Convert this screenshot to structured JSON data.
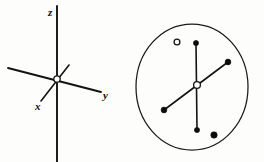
{
  "figure": {
    "width": 264,
    "height": 162,
    "background_color": "#fdfdfc",
    "ink_color": "#131313",
    "panels": [
      {
        "id": "axes-panel",
        "name": "cartesian-axes-diagram",
        "description": "Three dimensional cartesian coordinate axes drawn in perspective with a small open circle marking the origin."
      },
      {
        "id": "orbital-panel",
        "name": "circular-orbital-diagram",
        "description": "A large circle enclosing an open circle at the centre, a vertical segment terminating in filled dots at both ends, a diagonal segment terminating in filled dots at both ends, one free-standing open circle at upper left and one free-standing filled dot at lower right."
      }
    ]
  },
  "axes_diagram": {
    "origin_label": "origin-node",
    "origin": {
      "x": 57,
      "y": 79,
      "radius": 3.2,
      "style": "open"
    },
    "labels": [
      {
        "name": "z-axis-label",
        "text": "z",
        "x": 50,
        "y": 14
      },
      {
        "name": "y-axis-label",
        "text": "y",
        "x": 105,
        "y": 97
      },
      {
        "name": "x-axis-label",
        "text": "x",
        "x": 38,
        "y": 107
      }
    ],
    "axes": [
      {
        "name": "z-axis-line",
        "text": "z",
        "x1": 57,
        "y1": 6,
        "x2": 57,
        "y2": 162,
        "width": 1.9
      },
      {
        "name": "y-axis-line",
        "text": "y",
        "x1": 8,
        "y1": 68,
        "x2": 101,
        "y2": 92,
        "width": 1.9
      },
      {
        "name": "x-axis-line",
        "text": "x",
        "x1": 41,
        "y1": 101,
        "x2": 69,
        "y2": 65,
        "width": 1.6
      }
    ]
  },
  "orbital_diagram": {
    "ring": {
      "name": "outer-circle",
      "cx": 192,
      "cy": 87,
      "rx": 56,
      "ry": 63,
      "stroke_width": 1.25
    },
    "center_node": {
      "name": "center-open-circle",
      "cx": 197,
      "cy": 85,
      "r": 3.4,
      "style": "open"
    },
    "segments": [
      {
        "name": "vertical-segment",
        "x1": 196,
        "y1": 43,
        "x2": 197,
        "y2": 130,
        "width": 1.6
      },
      {
        "name": "diagonal-segment",
        "x1": 164,
        "y1": 110,
        "x2": 228,
        "y2": 62,
        "width": 1.6
      }
    ],
    "endpoint_nodes": [
      {
        "name": "vertical-top-dot",
        "cx": 196,
        "cy": 43,
        "r": 2.6,
        "style": "filled"
      },
      {
        "name": "vertical-bottom-dot",
        "cx": 197,
        "cy": 130,
        "r": 2.6,
        "style": "filled"
      },
      {
        "name": "diagonal-upper-right-dot",
        "cx": 228,
        "cy": 62,
        "r": 2.9,
        "style": "filled"
      },
      {
        "name": "diagonal-lower-left-dot",
        "cx": 164,
        "cy": 110,
        "r": 2.9,
        "style": "filled"
      }
    ],
    "free_nodes": [
      {
        "name": "free-open-circle",
        "cx": 177,
        "cy": 42,
        "r": 2.9,
        "style": "open"
      },
      {
        "name": "free-filled-dot",
        "cx": 214,
        "cy": 135,
        "r": 3.2,
        "style": "filled"
      }
    ]
  }
}
